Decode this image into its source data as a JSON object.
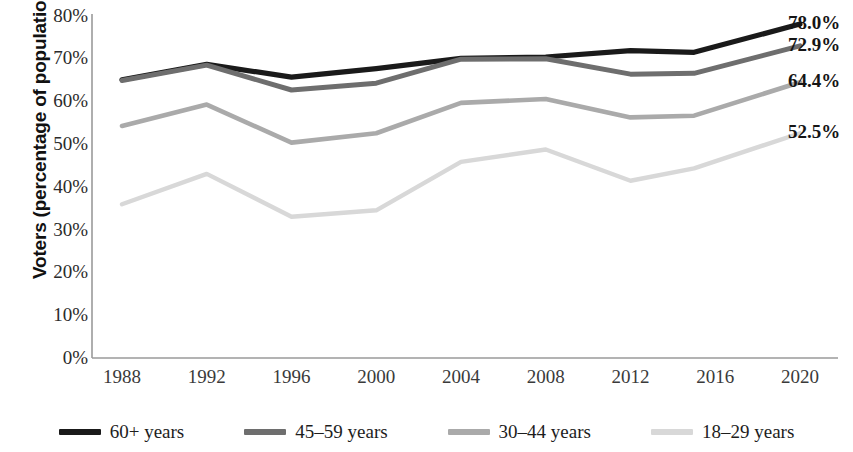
{
  "chart_data": {
    "type": "line",
    "title": "",
    "xlabel": "",
    "ylabel": "Voters (percentage of population)",
    "x": [
      1988,
      1992,
      1996,
      2000,
      2004,
      2008,
      2012,
      2015,
      2020
    ],
    "xtick_labels": [
      "1988",
      "1992",
      "1996",
      "2000",
      "2004",
      "2008",
      "2012",
      "2016",
      "2020"
    ],
    "ytick_labels": [
      "80%",
      "70%",
      "60%",
      "50%",
      "40%",
      "30%",
      "20%",
      "10%",
      "0%"
    ],
    "ylim": [
      0,
      80
    ],
    "xlim": [
      1987,
      2021
    ],
    "grid": false,
    "legend_position": "bottom",
    "series": [
      {
        "name": "60+ years",
        "color": "#1a1a1a",
        "end_label": "78.0%",
        "values": [
          65.0,
          68.6,
          65.6,
          67.6,
          70.0,
          70.3,
          71.8,
          71.4,
          78.0
        ]
      },
      {
        "name": "45–59 years",
        "color": "#6e6e6e",
        "end_label": "72.9%",
        "values": [
          64.8,
          68.4,
          62.6,
          64.2,
          69.8,
          69.9,
          66.3,
          66.5,
          72.9
        ]
      },
      {
        "name": "30–44 years",
        "color": "#aaaaaa",
        "end_label": "64.4%",
        "values": [
          54.2,
          59.2,
          50.3,
          52.5,
          59.6,
          60.5,
          56.2,
          56.6,
          64.4
        ]
      },
      {
        "name": "18–29 years",
        "color": "#d8d8d8",
        "end_label": "52.5%",
        "values": [
          35.9,
          43.0,
          33.0,
          34.5,
          45.8,
          48.7,
          41.4,
          44.3,
          52.5
        ]
      }
    ]
  },
  "axis": {
    "y_title": "Voters (percentage of population)"
  },
  "legend": {
    "items": [
      {
        "label": "60+ years",
        "color": "#1a1a1a"
      },
      {
        "label": "45–59 years",
        "color": "#6e6e6e"
      },
      {
        "label": "30–44 years",
        "color": "#aaaaaa"
      },
      {
        "label": "18–29 years",
        "color": "#d8d8d8"
      }
    ]
  }
}
